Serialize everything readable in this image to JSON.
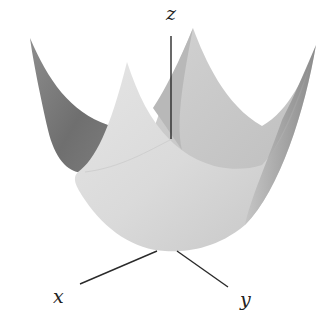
{
  "figure": {
    "axes": {
      "x_label": "x",
      "y_label": "y",
      "z_label": "z"
    },
    "surface": {
      "type": "paraboloid",
      "colors": {
        "front_face": "#dcdcdc",
        "back_face_right": "#c9c9c9",
        "inner_dark": "#7a7a7a",
        "right_edge_shade": "#8a8a8a",
        "axis": "#2a2a2a"
      }
    }
  }
}
